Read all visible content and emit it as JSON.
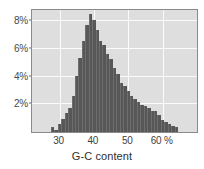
{
  "chart_data": {
    "type": "bar",
    "title": "",
    "subtitle": "",
    "xlabel": "G-C content",
    "ylabel": "",
    "xlim": [
      22,
      70
    ],
    "ylim": [
      0,
      8.8
    ],
    "grid": true,
    "legend": null,
    "bar_color": "#575757",
    "plot_background": "#dedede",
    "gridline_color": "#fbfbfb",
    "x_unit": "%",
    "y_unit": "%",
    "bin_width": 1,
    "x_ticks": [
      {
        "value": 30,
        "label": "30"
      },
      {
        "value": 40,
        "label": "40"
      },
      {
        "value": 50,
        "label": "50"
      },
      {
        "value": 60,
        "label": "60 %"
      }
    ],
    "y_ticks": [
      {
        "value": 2,
        "label": "2%"
      },
      {
        "value": 4,
        "label": "4%"
      },
      {
        "value": 6,
        "label": "6%"
      },
      {
        "value": 8,
        "label": "8%"
      }
    ],
    "categories": [
      28,
      29,
      30,
      31,
      32,
      33,
      34,
      35,
      36,
      37,
      38,
      39,
      40,
      41,
      42,
      43,
      44,
      45,
      46,
      47,
      48,
      49,
      50,
      51,
      52,
      53,
      54,
      55,
      56,
      57,
      58,
      59,
      60,
      61,
      62,
      63,
      64
    ],
    "values": [
      0.35,
      0.15,
      0.55,
      0.95,
      1.35,
      1.75,
      2.6,
      4.05,
      5.35,
      6.55,
      7.7,
      8.5,
      8.05,
      7.35,
      6.6,
      6.25,
      5.65,
      5.3,
      4.6,
      4.2,
      3.5,
      3.3,
      2.95,
      2.6,
      2.35,
      2.2,
      1.95,
      1.9,
      1.7,
      1.55,
      1.55,
      1.2,
      0.9,
      0.7,
      0.55,
      0.45,
      0.35
    ]
  },
  "axis": {
    "x_title": "G-C content"
  }
}
